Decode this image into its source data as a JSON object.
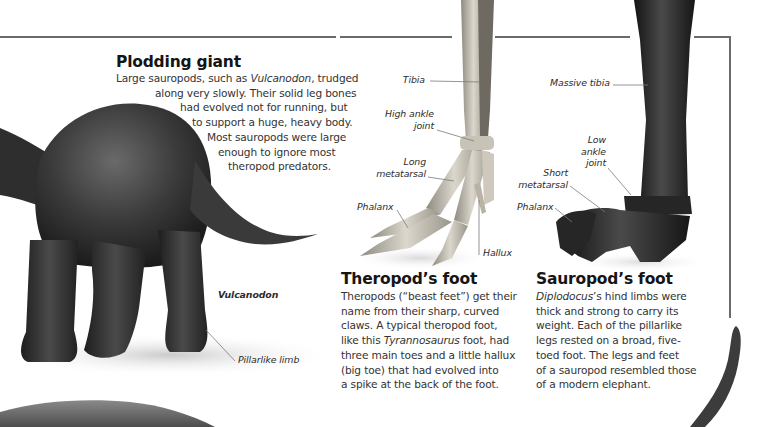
{
  "page": {
    "sections": {
      "plodding_giant": {
        "title": "Plodding giant",
        "lines": [
          {
            "pre": "Large sauropods, such as ",
            "em": "Vulcanodon",
            "post": ", trudged"
          },
          {
            "pre": "along very slowly. Their solid leg bones",
            "em": "",
            "post": ""
          },
          {
            "pre": "had evolved not for running, but",
            "em": "",
            "post": ""
          },
          {
            "pre": "to support a huge, heavy body.",
            "em": "",
            "post": ""
          },
          {
            "pre": "Most sauropods were large",
            "em": "",
            "post": ""
          },
          {
            "pre": "enough to ignore most",
            "em": "",
            "post": ""
          },
          {
            "pre": "theropod predators.",
            "em": "",
            "post": ""
          }
        ]
      },
      "theropod_foot": {
        "title": "Theropod’s foot",
        "lines": [
          {
            "pre": "Theropods (“beast feet”) get their",
            "em": "",
            "post": ""
          },
          {
            "pre": "name from their sharp, curved",
            "em": "",
            "post": ""
          },
          {
            "pre": "claws. A typical theropod foot,",
            "em": "",
            "post": ""
          },
          {
            "pre": "like this ",
            "em": "Tyrannosaurus",
            "post": " foot, had"
          },
          {
            "pre": "three main toes and a little hallux",
            "em": "",
            "post": ""
          },
          {
            "pre": "(big toe) that had evolved into",
            "em": "",
            "post": ""
          },
          {
            "pre": "a spike at the back of the foot.",
            "em": "",
            "post": ""
          }
        ]
      },
      "sauropod_foot": {
        "title": "Sauropod’s foot",
        "lines": [
          {
            "pre": "",
            "em": "Diplodocus",
            "post": "’s hind limbs were"
          },
          {
            "pre": "thick and strong to carry its",
            "em": "",
            "post": ""
          },
          {
            "pre": "weight. Each of the pillarlike",
            "em": "",
            "post": ""
          },
          {
            "pre": "legs rested on a broad, five-",
            "em": "",
            "post": ""
          },
          {
            "pre": "toed foot. The legs and feet",
            "em": "",
            "post": ""
          },
          {
            "pre": "of a sauropod resembled those",
            "em": "",
            "post": ""
          },
          {
            "pre": "of a modern elephant.",
            "em": "",
            "post": ""
          }
        ]
      }
    },
    "labels": {
      "vulcanodon": "Vulcanodon",
      "pillarlike_limb": "Pillarlike limb",
      "theropod": {
        "tibia": "Tibia",
        "high_ankle_joint_1": "High ankle",
        "high_ankle_joint_2": "joint",
        "long_metatarsal_1": "Long",
        "long_metatarsal_2": "metatarsal",
        "phalanx": "Phalanx",
        "hallux": "Hallux"
      },
      "sauropod": {
        "massive_tibia": "Massive tibia",
        "low_ankle_joint_1": "Low",
        "low_ankle_joint_2": "ankle",
        "low_ankle_joint_3": "joint",
        "short_metatarsal_1": "Short",
        "short_metatarsal_2": "metatarsal",
        "phalanx": "Phalanx"
      }
    },
    "colors": {
      "rule": "#6b6b6b",
      "heading": "#151515",
      "body": "#333333",
      "theropod_bone": "#d9d4c8",
      "sauropod_bone": "#2b2b2b",
      "dinosaur_skin": "#3a3a3a"
    }
  }
}
